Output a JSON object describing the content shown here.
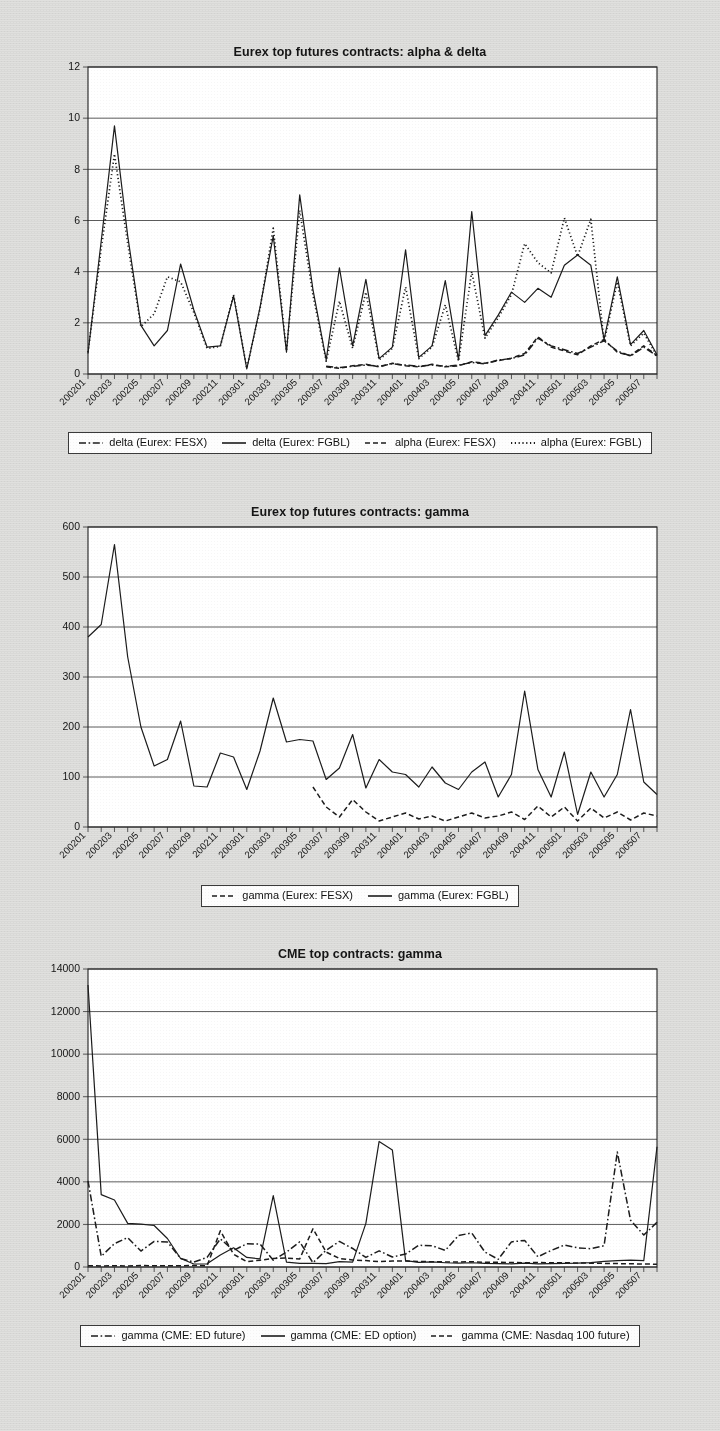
{
  "page": {
    "background_color": "#dcdcda",
    "plot_background_color": "#ffffff",
    "ink_color": "#1c1c1c"
  },
  "x_categories": [
    "200201",
    "200202",
    "200203",
    "200204",
    "200205",
    "200206",
    "200207",
    "200208",
    "200209",
    "200210",
    "200211",
    "200212",
    "200301",
    "200302",
    "200303",
    "200304",
    "200305",
    "200306",
    "200307",
    "200308",
    "200309",
    "200310",
    "200311",
    "200312",
    "200401",
    "200402",
    "200403",
    "200404",
    "200405",
    "200406",
    "200407",
    "200408",
    "200409",
    "200410",
    "200411",
    "200412",
    "200501",
    "200502",
    "200503",
    "200504",
    "200505",
    "200506",
    "200507",
    "200508"
  ],
  "x_tick_labels": [
    "200201",
    "200203",
    "200205",
    "200207",
    "200209",
    "200211",
    "200301",
    "200303",
    "200305",
    "200307",
    "200309",
    "200311",
    "200401",
    "200403",
    "200405",
    "200407",
    "200409",
    "200411",
    "200501",
    "200503",
    "200505",
    "200507"
  ],
  "charts": [
    {
      "id": "eurex-alpha-delta",
      "title": "Eurex top futures contracts: alpha & delta",
      "type": "line",
      "xlabel": "",
      "ylabel": "",
      "ylim": [
        0,
        12
      ],
      "yticks": [
        0,
        2,
        4,
        6,
        8,
        10,
        12
      ],
      "grid": true,
      "legend_position": "bottom",
      "series": [
        {
          "name": "delta (Eurex: FESX)",
          "style": "dashdot",
          "values": [
            null,
            null,
            null,
            null,
            null,
            null,
            null,
            null,
            null,
            null,
            null,
            null,
            null,
            null,
            null,
            null,
            null,
            null,
            0.3,
            0.25,
            0.3,
            0.35,
            0.3,
            0.4,
            0.35,
            0.3,
            0.35,
            0.3,
            0.35,
            0.45,
            0.4,
            0.55,
            0.6,
            0.75,
            1.4,
            1.1,
            0.95,
            0.8,
            1.05,
            1.3,
            0.9,
            0.7,
            1.05,
            0.7
          ]
        },
        {
          "name": "delta (Eurex: FGBL)",
          "style": "solid",
          "values": [
            0.8,
            5.2,
            9.7,
            5.4,
            1.9,
            1.1,
            1.7,
            4.3,
            2.5,
            1.05,
            1.1,
            3.05,
            0.2,
            2.6,
            5.4,
            0.85,
            7.0,
            3.3,
            0.55,
            4.15,
            1.1,
            3.7,
            0.6,
            1.05,
            4.85,
            0.65,
            1.1,
            3.65,
            0.55,
            6.35,
            1.5,
            2.3,
            3.2,
            2.8,
            3.35,
            3.0,
            4.25,
            4.65,
            4.25,
            1.35,
            3.8,
            1.15,
            1.7,
            0.75
          ]
        },
        {
          "name": "alpha (Eurex: FESX)",
          "style": "dashed",
          "values": [
            null,
            null,
            null,
            null,
            null,
            null,
            null,
            null,
            null,
            null,
            null,
            null,
            null,
            null,
            null,
            null,
            null,
            null,
            0.28,
            0.22,
            0.32,
            0.38,
            0.28,
            0.42,
            0.32,
            0.28,
            0.38,
            0.28,
            0.32,
            0.48,
            0.42,
            0.52,
            0.62,
            0.8,
            1.45,
            1.05,
            0.9,
            0.75,
            1.1,
            1.35,
            0.85,
            0.72,
            1.1,
            0.72
          ]
        },
        {
          "name": "alpha (Eurex: FGBL)",
          "style": "dotted",
          "values": [
            0.85,
            4.9,
            8.6,
            5.1,
            1.85,
            2.35,
            3.8,
            3.6,
            2.4,
            1.0,
            1.08,
            3.1,
            0.22,
            2.55,
            5.7,
            0.9,
            6.4,
            3.1,
            0.5,
            2.85,
            1.0,
            3.2,
            0.55,
            1.0,
            3.4,
            0.6,
            1.05,
            2.7,
            0.5,
            4.0,
            1.4,
            2.2,
            3.1,
            5.1,
            4.35,
            3.95,
            6.1,
            4.6,
            6.05,
            1.25,
            3.6,
            1.1,
            1.6,
            0.7
          ]
        }
      ]
    },
    {
      "id": "eurex-gamma",
      "title": "Eurex top futures contracts: gamma",
      "type": "line",
      "xlabel": "",
      "ylabel": "",
      "ylim": [
        0,
        600
      ],
      "yticks": [
        0,
        100,
        200,
        300,
        400,
        500,
        600
      ],
      "grid": true,
      "legend_position": "bottom",
      "series": [
        {
          "name": "gamma (Eurex: FESX)",
          "style": "dashed",
          "values": [
            null,
            null,
            null,
            null,
            null,
            null,
            null,
            null,
            null,
            null,
            null,
            null,
            null,
            null,
            null,
            null,
            null,
            80,
            40,
            20,
            55,
            30,
            12,
            20,
            28,
            16,
            22,
            12,
            20,
            28,
            18,
            22,
            30,
            15,
            42,
            20,
            40,
            12,
            38,
            18,
            30,
            14,
            28,
            22
          ]
        },
        {
          "name": "gamma (Eurex: FGBL)",
          "style": "solid",
          "values": [
            380,
            405,
            565,
            340,
            200,
            122,
            135,
            212,
            82,
            80,
            148,
            140,
            75,
            152,
            258,
            170,
            175,
            172,
            95,
            118,
            185,
            78,
            135,
            110,
            105,
            80,
            120,
            88,
            75,
            110,
            130,
            60,
            105,
            272,
            115,
            60,
            150,
            25,
            110,
            60,
            105,
            235,
            90,
            65
          ]
        }
      ]
    },
    {
      "id": "cme-gamma",
      "title": "CME top contracts: gamma",
      "type": "line",
      "xlabel": "",
      "ylabel": "",
      "ylim": [
        0,
        14000
      ],
      "yticks": [
        0,
        2000,
        4000,
        6000,
        8000,
        10000,
        12000,
        14000
      ],
      "grid": true,
      "legend_position": "bottom",
      "series": [
        {
          "name": "gamma (CME: ED future)",
          "style": "dashdot",
          "values": [
            4050,
            500,
            1100,
            1380,
            750,
            1200,
            1180,
            400,
            230,
            450,
            1320,
            780,
            1090,
            1080,
            320,
            700,
            1180,
            200,
            790,
            1200,
            870,
            450,
            760,
            470,
            610,
            1020,
            1000,
            780,
            1480,
            1600,
            700,
            360,
            1180,
            1250,
            480,
            780,
            1030,
            900,
            860,
            1000,
            5400,
            2200,
            1500,
            2100
          ]
        },
        {
          "name": "gamma (CME: ED option)",
          "style": "solid",
          "values": [
            13250,
            3400,
            3150,
            2050,
            2010,
            1950,
            1340,
            400,
            140,
            150,
            560,
            900,
            450,
            380,
            3350,
            230,
            170,
            170,
            160,
            250,
            230,
            2050,
            5900,
            5500,
            300,
            220,
            240,
            200,
            180,
            200,
            170,
            160,
            150,
            180,
            150,
            160,
            170,
            180,
            210,
            260,
            300,
            320,
            300,
            5650
          ]
        },
        {
          "name": "gamma (CME: Nasdaq 100 future)",
          "style": "dashed",
          "values": [
            60,
            50,
            60,
            50,
            70,
            60,
            55,
            60,
            70,
            60,
            1700,
            600,
            250,
            320,
            400,
            420,
            380,
            1800,
            700,
            400,
            330,
            300,
            250,
            280,
            280,
            260,
            250,
            240,
            230,
            250,
            220,
            220,
            210,
            200,
            210,
            200,
            200,
            190,
            180,
            170,
            160,
            150,
            140,
            130
          ]
        }
      ]
    }
  ]
}
